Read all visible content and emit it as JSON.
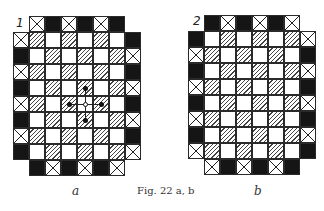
{
  "figure": {
    "caption": "Fig. 22 a, b",
    "boards": [
      {
        "id": "a",
        "number": "1",
        "sublabel": "a",
        "origin": [
          13,
          32
        ],
        "top_row": {
          "offset_col": 1,
          "cells": [
            "X",
            "B",
            "X",
            "B",
            "X",
            "B"
          ]
        },
        "rows": [
          [
            "X",
            "H",
            "W",
            "H",
            "W",
            "H",
            "W",
            "B"
          ],
          [
            "B",
            "W",
            "H",
            "W",
            "H",
            "W",
            "H",
            "X"
          ],
          [
            "X",
            "H",
            "W",
            "H",
            "W",
            "H",
            "W",
            "B"
          ],
          [
            "B",
            "W",
            "H",
            "W",
            "H",
            "W",
            "H",
            "X"
          ],
          [
            "X",
            "H",
            "W",
            "H",
            "W",
            "H",
            "W",
            "B"
          ],
          [
            "B",
            "W",
            "H",
            "W",
            "H",
            "W",
            "H",
            "X"
          ],
          [
            "X",
            "H",
            "W",
            "H",
            "W",
            "H",
            "W",
            "B"
          ],
          [
            "B",
            "W",
            "H",
            "W",
            "H",
            "W",
            "H",
            "X"
          ]
        ],
        "bottom_row": {
          "offset_col": 1,
          "cells": [
            "B",
            "X",
            "B",
            "X",
            "B",
            "X"
          ]
        },
        "markers": {
          "center": {
            "row": 4,
            "col": 4,
            "type": "open-circle"
          },
          "dots": [
            {
              "row": 3,
              "col": 4
            },
            {
              "row": 5,
              "col": 4
            },
            {
              "row": 4,
              "col": 3
            },
            {
              "row": 4,
              "col": 5
            }
          ]
        }
      },
      {
        "id": "b",
        "number": "2",
        "sublabel": "b",
        "origin": [
          188,
          31
        ],
        "top_row": {
          "offset_col": 1,
          "cells": [
            "B",
            "X",
            "B",
            "X",
            "B",
            "X"
          ]
        },
        "rows": [
          [
            "B",
            "W",
            "H",
            "W",
            "H",
            "W",
            "H",
            "X"
          ],
          [
            "X",
            "H",
            "W",
            "H",
            "W",
            "H",
            "W",
            "B"
          ],
          [
            "B",
            "W",
            "H",
            "W",
            "H",
            "W",
            "H",
            "X"
          ],
          [
            "X",
            "H",
            "W",
            "H",
            "W",
            "H",
            "W",
            "B"
          ],
          [
            "B",
            "W",
            "H",
            "W",
            "H",
            "W",
            "H",
            "X"
          ],
          [
            "X",
            "H",
            "W",
            "H",
            "W",
            "H",
            "W",
            "B"
          ],
          [
            "B",
            "W",
            "H",
            "W",
            "H",
            "W",
            "H",
            "X"
          ],
          [
            "X",
            "H",
            "W",
            "H",
            "W",
            "H",
            "W",
            "B"
          ]
        ],
        "bottom_row": {
          "offset_col": 1,
          "cells": [
            "X",
            "B",
            "X",
            "B",
            "X",
            "B"
          ]
        }
      }
    ],
    "legend_codes": {
      "B": "black",
      "X": "crossed",
      "H": "hatched",
      "W": "white"
    }
  }
}
